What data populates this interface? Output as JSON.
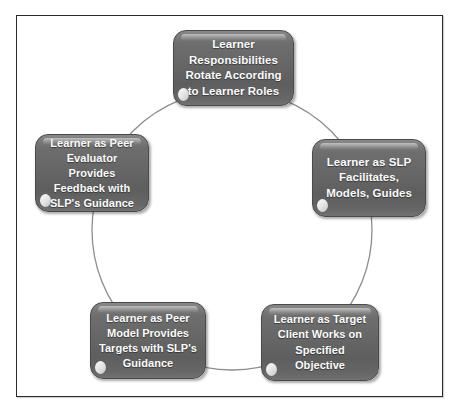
{
  "diagram": {
    "type": "cycle-diagram",
    "title": "Learner Responsibilities Rotate According to Learner Roles",
    "frame_color": "#2b2b2b",
    "box_fill_color": "#666666",
    "box_text_color": "#fbfbfb",
    "circle_color": "#8d8d8d",
    "background_color": "#ffffff",
    "nodes": [
      {
        "id": "top",
        "position": "top",
        "label": "Learner\nResponsibilities\nRotate According\nto Learner Roles"
      },
      {
        "id": "right",
        "position": "right",
        "label": "Learner as SLP\nFacilitates,\nModels, Guides"
      },
      {
        "id": "bottom-right",
        "position": "bottom-right",
        "label": "Learner as Target\nClient Works on\nSpecified Objective"
      },
      {
        "id": "bottom-left",
        "position": "bottom-left",
        "label": "Learner as Peer\nModel  Provides\nTargets  with SLP's\nGuidance"
      },
      {
        "id": "left",
        "position": "left",
        "label": "Learner as Peer\nEvaluator Provides\nFeedback with\nSLP's Guidance"
      }
    ]
  }
}
